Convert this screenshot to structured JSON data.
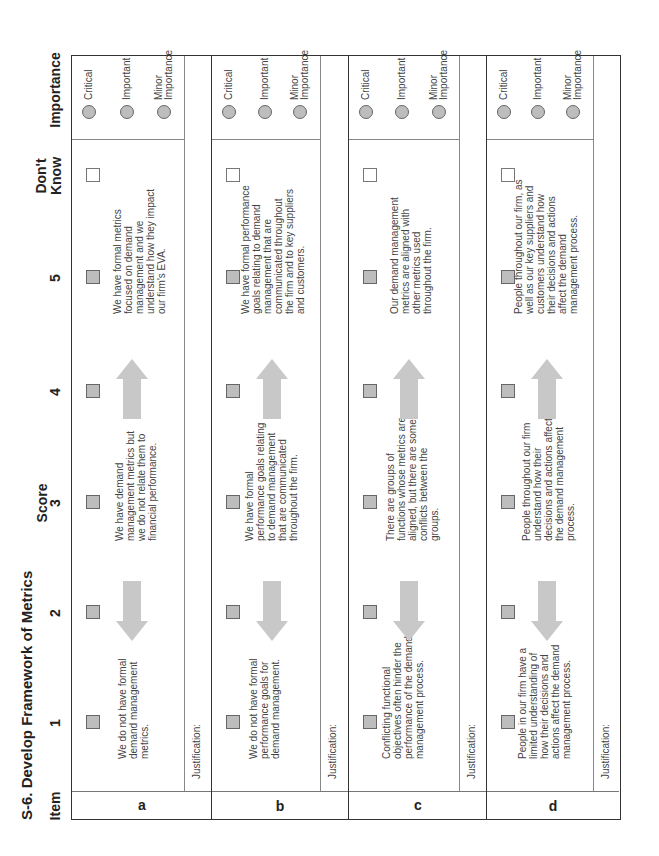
{
  "title": "S-6. Develop Framework of Metrics",
  "headers": {
    "item": "Item",
    "score": "Score",
    "score_columns": [
      "1",
      "2",
      "3",
      "4",
      "5"
    ],
    "dont_know_line1": "Don't",
    "dont_know_line2": "Know",
    "importance": "Importance"
  },
  "importance_options": [
    "Critical",
    "Important",
    "Minor Importance"
  ],
  "justification_label": "Justification:",
  "items": [
    {
      "letter": "a",
      "level1": "We do not have formal demand management metrics.",
      "level3": "We have demand management metrics but we do not relate them to financial performance.",
      "level5": "We have formal metrics focused on demand management and we understand how they impact our firm's EVA."
    },
    {
      "letter": "b",
      "level1": "We do not have formal performance goals for demand management.",
      "level3": "We have formal performance goals relating to demand management that are communicated throughout the firm.",
      "level5": "We have formal performance goals relating to demand management that are communicated throughout the firm and to key suppliers and customers."
    },
    {
      "letter": "c",
      "level1": "Conflicting functional objectives often hinder the performance of the demand management process.",
      "level3": "There are groups of functions whose metrics are aligned, but there are some conflicts between the groups.",
      "level5": "Our demand management metrics are aligned with other metrics used throughout the firm."
    },
    {
      "letter": "d",
      "level1": "People in our firm have a limited understanding of how their decisions and actions affect the demand management process.",
      "level3": "People throughout our firm understand how their decisions and actions affect the demand management process.",
      "level5": "People throughout our firm, as well as our key suppliers and customers understand how their decisions and actions affect the demand management process."
    }
  ],
  "colors": {
    "checkbox_fill": "#bdbdbd",
    "arrow_fill": "#c8c8c8",
    "border": "#333333"
  }
}
